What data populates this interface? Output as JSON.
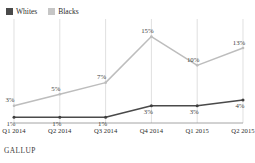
{
  "chart_data": {
    "type": "line",
    "title": "",
    "subtitle": "",
    "xlabel": "",
    "ylabel": "",
    "categories": [
      "Q1 2014",
      "Q2 2014",
      "Q3 2014",
      "Q4 2014",
      "Q1 2015",
      "Q2 2015"
    ],
    "series": [
      {
        "name": "Whites",
        "color": "#4a4a4a",
        "values": [
          1,
          1,
          1,
          3,
          3,
          4
        ],
        "labels": [
          "1%",
          "1%",
          "1%",
          "3%",
          "3%",
          "4%"
        ]
      },
      {
        "name": "Blacks",
        "color": "#b9b9b9",
        "values": [
          3,
          5,
          7,
          15,
          10,
          13
        ],
        "labels": [
          "3%",
          "5%",
          "7%",
          "15%",
          "10%",
          "13%"
        ]
      }
    ],
    "ylim": [
      0,
      17
    ],
    "grid": "vertical",
    "legend_position": "top-left",
    "source": "GALLUP"
  },
  "legend": {
    "items": [
      {
        "label": "Whites",
        "color": "#4a4a4a"
      },
      {
        "label": "Blacks",
        "color": "#c6c6c6"
      }
    ]
  },
  "footer": {
    "source": "GALLUP"
  },
  "colors": {
    "whites_line": "#4a4a4a",
    "blacks_line": "#bdbdbd",
    "gridline": "#d2d2d2",
    "axis": "#8e8e8e",
    "text": "#2b2b2b"
  }
}
